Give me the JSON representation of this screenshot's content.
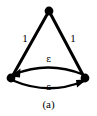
{
  "figure": {
    "caption": "(a)",
    "background_color": "#ffffff",
    "ink_color": "#000000",
    "width": 97,
    "height": 116
  },
  "graph": {
    "nodes": [
      {
        "id": "top",
        "name": "node-top",
        "cx": 49,
        "cy": 11,
        "r": 4.2
      },
      {
        "id": "bottom-left",
        "name": "node-bottom-left",
        "cx": 11,
        "cy": 78,
        "r": 4.2
      },
      {
        "id": "bottom-right",
        "name": "node-bottom-right",
        "cx": 85,
        "cy": 78,
        "r": 4.2
      }
    ],
    "edges": [
      {
        "id": "left-leg",
        "from": "top",
        "to": "bottom-left",
        "label": "1",
        "directed": false,
        "shape": "straight"
      },
      {
        "id": "right-leg",
        "from": "top",
        "to": "bottom-right",
        "label": "1",
        "directed": false,
        "shape": "straight"
      },
      {
        "id": "upper-arc",
        "from": "bottom-right",
        "to": "bottom-left",
        "label": "ε",
        "directed": true,
        "shape": "arc"
      },
      {
        "id": "lower-arc",
        "from": "bottom-left",
        "to": "bottom-right",
        "label": "ε",
        "directed": true,
        "shape": "arc"
      }
    ]
  },
  "labels": {
    "left_weight": "1",
    "right_weight": "1",
    "upper_epsilon": "ε",
    "lower_epsilon": "ε"
  }
}
